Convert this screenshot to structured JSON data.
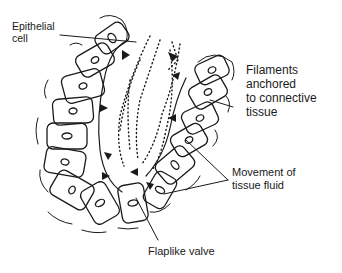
{
  "diagram": {
    "labels": {
      "epithelial_cell": {
        "line1": "Epithelial",
        "line2": "cell"
      },
      "filaments": {
        "line1": "Filaments",
        "line2": "anchored",
        "line3": "to connective",
        "line4": "tissue"
      },
      "movement": {
        "line1": "Movement of",
        "line2": "tissue fluid"
      },
      "flaplike_valve": {
        "line1": "Flaplike valve"
      }
    },
    "colors": {
      "ink": "#1a1a1a",
      "background": "#ffffff"
    }
  }
}
